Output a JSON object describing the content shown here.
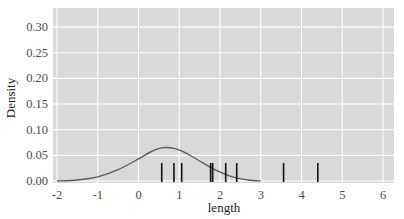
{
  "chart_data": {
    "type": "density",
    "title": "",
    "xlabel": "length",
    "ylabel": "Density",
    "xlim": [
      -2,
      6.2
    ],
    "ylim": [
      0,
      0.33
    ],
    "x_ticks": [
      -2,
      -1,
      0,
      1,
      2,
      3,
      4,
      5,
      6
    ],
    "x_tick_labels": [
      "-2",
      "-1",
      "0",
      "1",
      "2",
      "3",
      "4",
      "5",
      "6"
    ],
    "y_ticks": [
      0,
      0.05,
      0.1,
      0.15,
      0.2,
      0.25,
      0.3
    ],
    "y_tick_labels": [
      "0.00",
      "0.05",
      "0.10",
      "0.15",
      "0.20",
      "0.25",
      "0.30"
    ],
    "grid": true,
    "legend": null,
    "series": [
      {
        "name": "density",
        "type": "line",
        "color": "#5a5a5a",
        "x": [
          -2.0,
          -1.5,
          -1.0,
          -0.5,
          0.0,
          0.3,
          0.6,
          0.9,
          1.2,
          1.5,
          1.8,
          2.1,
          2.4,
          2.7,
          3.0
        ],
        "y": [
          0.0,
          0.002,
          0.008,
          0.022,
          0.043,
          0.057,
          0.065,
          0.063,
          0.053,
          0.039,
          0.025,
          0.014,
          0.006,
          0.002,
          0.0
        ]
      },
      {
        "name": "rug",
        "type": "rug",
        "color": "#111111",
        "x": [
          0.57,
          0.87,
          1.06,
          1.77,
          1.82,
          2.14,
          2.41,
          3.56,
          4.4
        ]
      }
    ]
  },
  "colors": {
    "panel_bg": "#d9d9d9",
    "grid": "#ffffff",
    "curve": "#5a5a5a",
    "rug": "#111111"
  }
}
